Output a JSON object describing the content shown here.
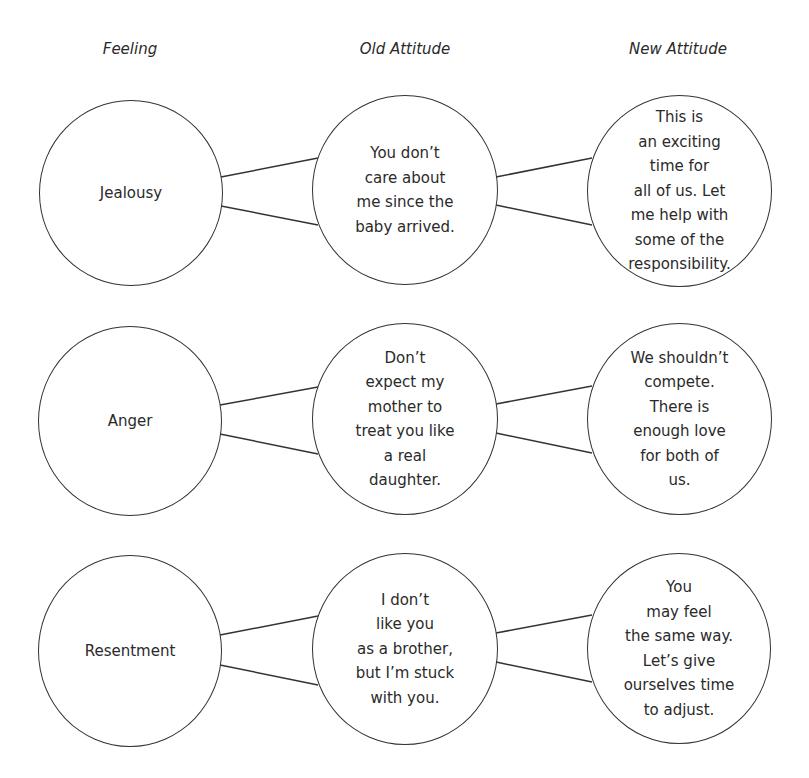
{
  "headers": {
    "feeling": "Feeling",
    "old_attitude": "Old Attitude",
    "new_attitude": "New Attitude"
  },
  "rows": [
    {
      "feeling": "Jealousy",
      "old_attitude": "You don’t\ncare about\nme since the\nbaby arrived.",
      "new_attitude": "This is\nan exciting\ntime for\nall of us. Let\nme help with\nsome of the\nresponsibility."
    },
    {
      "feeling": "Anger",
      "old_attitude": "Don’t\nexpect my\nmother to\ntreat you like\na real\ndaughter.",
      "new_attitude": "We shouldn’t\ncompete.\nThere is\nenough love\nfor both of\nus."
    },
    {
      "feeling": "Resentment",
      "old_attitude": "I don’t\nlike you\nas a brother,\nbut I’m stuck\nwith you.",
      "new_attitude": "You\nmay feel\nthe same way.\nLet’s give\nourselves time\nto adjust."
    }
  ],
  "colors": {
    "stroke": "#333333",
    "text": "#2a2a2a",
    "background": "#ffffff"
  }
}
